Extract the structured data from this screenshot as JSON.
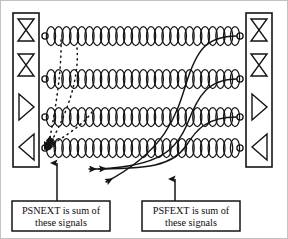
{
  "figure": {
    "background_color": "#ffffff",
    "line_color": "#1a1a1a",
    "frame_color": "#b8b8b8"
  },
  "annotations": [
    {
      "id": "psnext",
      "name": "psnext-callout",
      "line1": "PSNEXT is sum of",
      "line2": "these signals",
      "box": {
        "x": 12,
        "y": 201,
        "width": 98,
        "height": 30
      },
      "pointer": {
        "x": 57,
        "y_top": 163,
        "y_bottom": 201
      }
    },
    {
      "id": "psfext",
      "name": "psfext-callout",
      "line1": "PSFEXT is sum of",
      "line2": "these signals",
      "box": {
        "x": 142,
        "y": 201,
        "width": 98,
        "height": 30
      },
      "pointer": {
        "x": 175,
        "y_top": 180,
        "y_bottom": 201
      }
    }
  ],
  "connectors": [
    {
      "id": "left-connector",
      "name": "left-connector-block",
      "side": "left",
      "x": 13,
      "y": 13,
      "width": 26,
      "height": 154,
      "symbols": [
        "bowtie",
        "bowtie",
        "triangle-right",
        "triangle-left"
      ]
    },
    {
      "id": "right-connector",
      "name": "right-connector-block",
      "side": "right",
      "x": 246,
      "y": 13,
      "width": 26,
      "height": 154,
      "symbols": [
        "bowtie",
        "bowtie",
        "triangle-right",
        "triangle-left"
      ]
    }
  ],
  "pairs": [
    {
      "id": "pair-1",
      "name": "twisted-pair-1",
      "y": 36,
      "x_start": 43,
      "x_end": 242,
      "twists": 25
    },
    {
      "id": "pair-2",
      "name": "twisted-pair-2",
      "y": 79,
      "x_start": 43,
      "x_end": 242,
      "twists": 25
    },
    {
      "id": "pair-3",
      "name": "twisted-pair-3",
      "y": 117,
      "x_start": 43,
      "x_end": 242,
      "twists": 25
    },
    {
      "id": "pair-4",
      "name": "twisted-pair-4",
      "y": 148,
      "x_start": 43,
      "x_end": 242,
      "twists": 25
    }
  ],
  "next_paths": {
    "style": "dotted",
    "label": "near-end crosstalk coupling",
    "converge_at": {
      "x": 49,
      "y": 146
    },
    "sources": [
      {
        "from_pair": "pair-1",
        "x": 49,
        "y": 36
      },
      {
        "from_pair": "pair-2",
        "x": 49,
        "y": 79
      },
      {
        "from_pair": "pair-3",
        "x": 49,
        "y": 117
      }
    ]
  },
  "fext_paths": {
    "style": "solid",
    "label": "far-end crosstalk coupling",
    "sources": [
      {
        "from_pair": "pair-1",
        "x": 239,
        "y": 36
      },
      {
        "from_pair": "pair-2",
        "x": 239,
        "y": 79
      },
      {
        "from_pair": "pair-3",
        "x": 239,
        "y": 117
      }
    ],
    "arrow_targets": [
      {
        "x": 89,
        "y": 169
      },
      {
        "x": 99,
        "y": 169
      },
      {
        "x": 106,
        "y": 182
      }
    ]
  }
}
